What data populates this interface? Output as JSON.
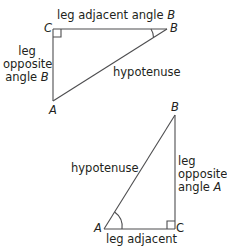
{
  "diagram": {
    "stroke_color": "#4d4d4f",
    "text_color": "#231f20",
    "triangle_1": {
      "vertices": {
        "C": "C",
        "B": "B",
        "A": "A"
      },
      "labels": {
        "top_leg": "leg adjacent angle",
        "top_leg_var": "B",
        "left_leg_line1": "leg",
        "left_leg_line2": "opposite",
        "left_leg_line3": "angle",
        "left_leg_var": "B",
        "hypotenuse": "hypotenuse"
      }
    },
    "triangle_2": {
      "vertices": {
        "B": "B",
        "A": "A",
        "C": "C"
      },
      "labels": {
        "hypotenuse": "hypotenuse",
        "right_leg_line1": "leg",
        "right_leg_line2": "opposite",
        "right_leg_line3": "angle",
        "right_leg_var": "A",
        "bottom_leg": "leg adjacent"
      }
    }
  }
}
